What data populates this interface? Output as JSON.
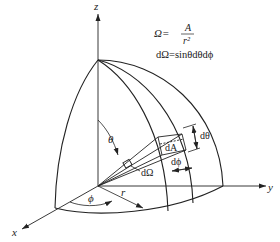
{
  "diagram": {
    "type": "solid-angle-sphere-octant",
    "axes": {
      "x": "x",
      "y": "y",
      "z": "z"
    },
    "angles": {
      "polar": "θ",
      "azimuthal": "ϕ"
    },
    "radius_label": "r",
    "element_labels": {
      "area": "dA",
      "solid_angle": "dΩ",
      "d_theta": "dθ",
      "d_phi": "dϕ"
    },
    "equations": {
      "omega_lhs": "Ω=",
      "omega_num": "A",
      "omega_den": "r²",
      "differential": "dΩ=sinθdθdϕ"
    },
    "line_color": "#222222"
  }
}
